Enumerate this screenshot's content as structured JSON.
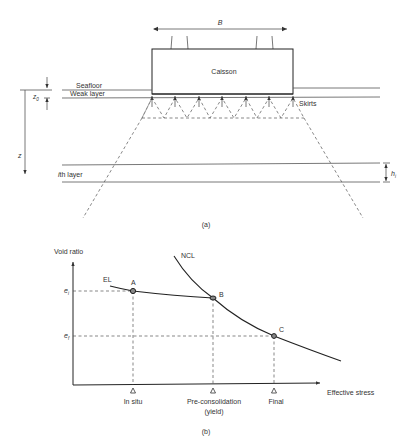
{
  "figure_a": {
    "caption": "(a)",
    "width_label": "B",
    "caisson_label": "Caisson",
    "seafloor_label": "Seafloor",
    "weak_layer_label": "Weak layer",
    "skirts_label": "Skirts",
    "z0_label": "z",
    "z0_sub": "0",
    "depth_label": "z",
    "ith_layer_label_i": "i",
    "ith_layer_label_rest": "th layer",
    "layer_thickness_label": "h",
    "layer_thickness_sub": "i"
  },
  "figure_b": {
    "caption": "(b)",
    "y_axis_label": "Void ratio",
    "x_axis_label": "Effective stress",
    "el_label": "EL",
    "ncl_label": "NCL",
    "ei_label": "e",
    "ei_sub": "i",
    "ef_label": "e",
    "ef_sub": "f",
    "points": [
      {
        "id": "A",
        "label": "A"
      },
      {
        "id": "B",
        "label": "B"
      },
      {
        "id": "C",
        "label": "C"
      }
    ],
    "x_markers": [
      {
        "label": "In situ"
      },
      {
        "label": "Pre-consolidation",
        "label2": "(yield)"
      },
      {
        "label": "Final"
      }
    ]
  },
  "colors": {
    "line": "#555555",
    "curve": "#222222",
    "point_fill": "#888888",
    "text": "#333333"
  }
}
